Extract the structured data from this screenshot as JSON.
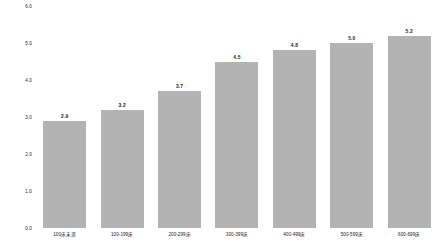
{
  "chart_data": {
    "type": "bar",
    "title": "",
    "subtitle": "",
    "xlabel": "",
    "ylabel": "",
    "ylim": [
      0.0,
      6.0
    ],
    "grid": false,
    "legend": null,
    "legend_position": "none",
    "bar_color": "#b3b3b3",
    "background_color": "#ffffff",
    "text_color": "#1a1a1a",
    "value_labels_shown": true,
    "yticks": [
      "6.0",
      "5.0",
      "4.0",
      "3.0",
      "2.0",
      "1.0",
      "0.0"
    ],
    "ytick_values": [
      6.0,
      5.0,
      4.0,
      3.0,
      2.0,
      1.0,
      0.0
    ],
    "categories": [
      "100床未満",
      "100-199床",
      "200-299床",
      "300-399床",
      "400-499床",
      "500-599床",
      "600-699床"
    ],
    "values": [
      2.9,
      3.2,
      3.7,
      4.5,
      4.8,
      5.0,
      5.2
    ],
    "value_labels": [
      "2.9",
      "3.2",
      "3.7",
      "4.5",
      "4.8",
      "5.0",
      "5.2"
    ]
  }
}
